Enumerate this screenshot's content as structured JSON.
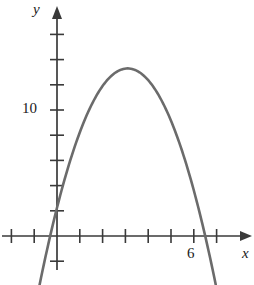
{
  "figure": {
    "title": "",
    "background_color": "#ffffff"
  },
  "axes": {
    "x_axis": {
      "name": "x-axis",
      "label": "x",
      "label_style": "italic",
      "arrow": true,
      "visible_tick_labels": [
        "6"
      ],
      "tick_values": [
        -2,
        -1,
        0,
        1,
        2,
        3,
        4,
        5,
        6,
        7,
        8
      ],
      "range": [
        -2.5,
        8.4
      ]
    },
    "y_axis": {
      "name": "y-axis",
      "label": "y",
      "label_style": "italic",
      "arrow": true,
      "visible_tick_labels": [
        "10"
      ],
      "tick_values": [
        -2,
        2,
        4,
        6,
        8,
        10,
        12,
        14,
        16
      ],
      "range": [
        -4,
        17.5
      ]
    }
  },
  "colors": {
    "curve": "#6b6b6b",
    "axis": "#3a3a3a",
    "text": "#1a1a1a",
    "background": "#ffffff"
  },
  "chart_data": {
    "type": "line",
    "title": "",
    "xlabel": "x",
    "ylabel": "y",
    "xlim": [
      -2.5,
      8.4
    ],
    "ylim": [
      -4,
      17.5
    ],
    "grid": false,
    "legend": "none",
    "series": [
      {
        "name": "parabola",
        "shape": "downward parabola",
        "equation": "y = -2(x - 3.1)^2 + 13.3",
        "vertex": [
          3.1,
          13.3
        ],
        "roots": [
          -0.3,
          6.5
        ],
        "y_intercept": 4.1,
        "color": "#6b6b6b",
        "x": [
          -1.0,
          -0.5,
          -0.3,
          0.0,
          0.5,
          1.0,
          1.5,
          2.0,
          2.5,
          3.1,
          3.5,
          4.0,
          4.5,
          5.0,
          5.5,
          6.0,
          6.5,
          7.0,
          7.5
        ],
        "y": [
          -20.3,
          -12.6,
          -9.3,
          4.1,
          -0.2,
          4.5,
          8.2,
          10.9,
          12.6,
          13.3,
          13.0,
          11.7,
          9.4,
          6.1,
          1.8,
          -3.5,
          -9.8,
          -17.1,
          -25.4
        ]
      }
    ],
    "annotations": [
      {
        "name": "y-tick-label-10",
        "text": "10",
        "x_value": 0,
        "y_value": 10
      },
      {
        "name": "x-tick-label-6",
        "text": "6",
        "x_value": 6,
        "y_value": 0
      }
    ]
  },
  "labels": {
    "y_axis_label": "y",
    "x_axis_label": "x",
    "y_tick_10": "10",
    "x_tick_6": "6"
  }
}
